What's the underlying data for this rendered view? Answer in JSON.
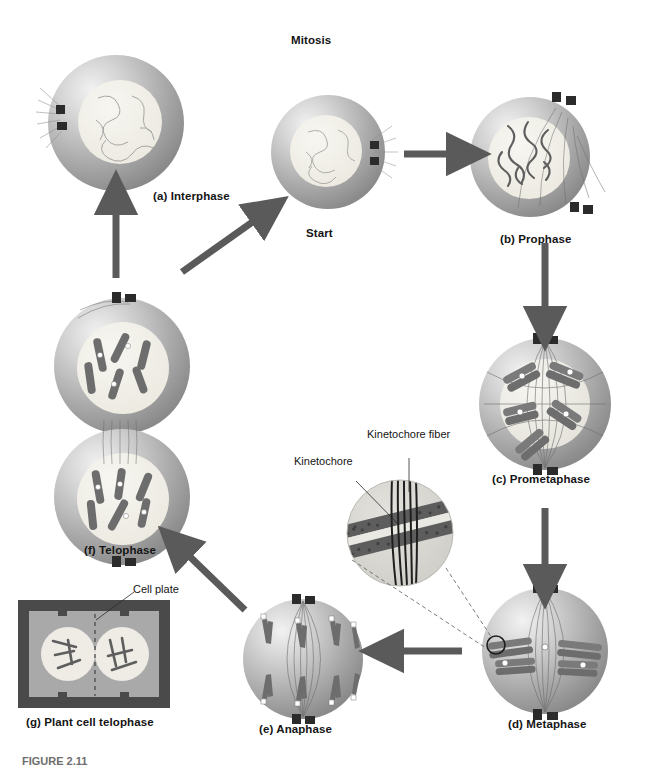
{
  "figure": {
    "title": "Mitosis",
    "start_label": "Start",
    "caption": "FIGURE 2.11",
    "colors": {
      "cytoplasm_light": "#e8e8e8",
      "cytoplasm_mid": "#b4b4b4",
      "cytoplasm_dark": "#8a8a8a",
      "nucleus": "#f0efe9",
      "chromosome": "#7a7a7a",
      "chromosome_dark": "#5e5e5e",
      "centriole": "#2b2b2b",
      "arrow": "#5a5a5a",
      "spindle": "#6f6f6f",
      "text": "#151515",
      "plant_wall": "#4a4a4a",
      "plant_cytoplasm": "#a9a9a9"
    }
  },
  "stages": [
    {
      "id": "interphase",
      "label": "(a) Interphase",
      "chromosome_state": "chromatin threads",
      "nucleus": true,
      "centriole_pairs": 1
    },
    {
      "id": "start",
      "label": "Start",
      "chromosome_state": "chromatin threads",
      "nucleus": true,
      "centriole_pairs": 1
    },
    {
      "id": "prophase",
      "label": "(b) Prophase",
      "chromosome_state": "condensing chromosomes",
      "nucleus": true,
      "centriole_pairs": 2
    },
    {
      "id": "prometaphase",
      "label": "(c) Prometaphase",
      "chromosome_state": "condensed chromosomes, nuclear envelope breaking down",
      "nucleus": true,
      "centriole_pairs": 2
    },
    {
      "id": "metaphase",
      "label": "(d) Metaphase",
      "chromosome_state": "chromosomes aligned on metaphase plate",
      "nucleus": false,
      "centriole_pairs": 2
    },
    {
      "id": "anaphase",
      "label": "(e) Anaphase",
      "chromosome_state": "sister chromatids separating to poles",
      "nucleus": false,
      "centriole_pairs": 2
    },
    {
      "id": "telophase",
      "label": "(f) Telophase",
      "chromosome_state": "two daughter nuclei reforming",
      "nucleus": true,
      "centriole_pairs": 2
    },
    {
      "id": "plant_telophase",
      "label": "(g) Plant cell telophase",
      "chromosome_state": "two daughter nuclei separated by cell plate",
      "nucleus": true,
      "centriole_pairs": 0
    }
  ],
  "inset": {
    "labels": {
      "kinetochore": "Kinetochore",
      "kinetochore_fiber": "Kinetochore fiber"
    }
  },
  "plant_inset": {
    "labels": {
      "cell_plate": "Cell plate"
    }
  }
}
